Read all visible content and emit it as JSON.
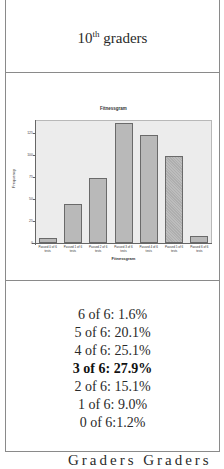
{
  "header": {
    "grade_number": "10",
    "grade_suffix": "th",
    "grade_label": " graders"
  },
  "chart_data": {
    "type": "bar",
    "title": "Fitnessgram",
    "xlabel": "Fitnessgram",
    "ylabel": "Frequency",
    "categories": [
      "Passed 0 of 6 tests",
      "Passed 1 of 6 tests",
      "Passed 2 of 6 tests",
      "Passed 3 of 6 tests",
      "Passed 4 of 6 tests",
      "Passed 5 of 6 tests",
      "Passed 6 of 6 tests"
    ],
    "tick_labels": [
      {
        "line1": "Passed 0 of 6",
        "line2": "tests"
      },
      {
        "line1": "Passed 1 of 6",
        "line2": "tests"
      },
      {
        "line1": "Passed 2 of 6",
        "line2": "tests"
      },
      {
        "line1": "Passed 3 of 6",
        "line2": "tests"
      },
      {
        "line1": "Passed 4 of 6",
        "line2": "tests"
      },
      {
        "line1": "Passed 5 of 6",
        "line2": "tests"
      },
      {
        "line1": "Passed 6 of 6",
        "line2": "tests"
      }
    ],
    "values": [
      6,
      44,
      74,
      137,
      123,
      99,
      8
    ],
    "yticks": [
      "0",
      "25",
      "50",
      "75",
      "100",
      "125"
    ],
    "ylim": [
      0,
      140
    ],
    "grid": false,
    "legend": "none"
  },
  "stats": {
    "lines": [
      {
        "text": "6 of 6: 1.6%",
        "bold": false
      },
      {
        "text": "5 of 6: 20.1%",
        "bold": false
      },
      {
        "text": "4 of 6: 25.1%",
        "bold": false
      },
      {
        "text": "3 of 6: 27.9%",
        "bold": true
      },
      {
        "text": "2 of 6: 15.1%",
        "bold": false
      },
      {
        "text": "1 of 6: 9.0%",
        "bold": false
      },
      {
        "text": "0 of 6:1.2%",
        "bold": false
      }
    ]
  },
  "footer": {
    "cutoff_text": "Graders Graders"
  }
}
